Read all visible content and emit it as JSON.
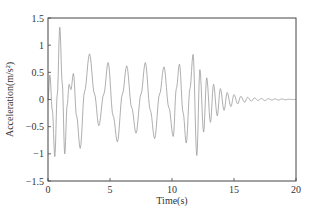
{
  "chart_data": {
    "type": "line",
    "title": "",
    "xlabel": "Time(s)",
    "ylabel": "Acceleration(m/s²)",
    "xlim": [
      0,
      20
    ],
    "ylim": [
      -1.5,
      1.5
    ],
    "xticks": [
      0,
      5,
      10,
      15,
      20
    ],
    "xtick_labels": [
      "0",
      "5",
      "10",
      "15",
      "20"
    ],
    "yticks": [
      1.5,
      1,
      0.5,
      0,
      -0.5,
      -1,
      -1.5
    ],
    "ytick_labels": [
      "1.5",
      "1",
      "0.5",
      "0",
      "-0.5",
      "-1",
      "-1.5"
    ],
    "grid": false,
    "legend": null,
    "line_color": "#9a9a9a",
    "series": [
      {
        "name": "acceleration",
        "x": [
          0,
          0.15,
          0.35,
          0.55,
          0.75,
          0.95,
          1.15,
          1.35,
          1.55,
          1.7,
          1.85,
          2.05,
          2.3,
          2.6,
          2.95,
          3.35,
          3.75,
          4.1,
          4.5,
          4.85,
          5.25,
          5.6,
          6.0,
          6.35,
          6.75,
          7.1,
          7.5,
          7.85,
          8.25,
          8.6,
          9.0,
          9.35,
          9.75,
          10.1,
          10.35,
          10.6,
          10.9,
          11.15,
          11.45,
          11.7,
          12.0,
          12.25,
          12.55,
          12.8,
          13.1,
          13.35,
          13.65,
          13.9,
          14.2,
          14.45,
          14.75,
          15.0,
          15.3,
          15.55,
          15.85,
          16.1,
          16.4,
          16.65,
          16.95,
          17.2,
          17.5,
          17.75,
          18.05,
          18.3,
          18.6,
          18.85,
          19.15,
          19.4,
          19.7,
          20.0
        ],
        "y": [
          0.0,
          0.45,
          -0.2,
          -1.05,
          0.1,
          1.33,
          0.3,
          -1.0,
          -0.1,
          0.28,
          0.18,
          0.48,
          -0.3,
          -0.9,
          0.15,
          0.84,
          0.1,
          -0.48,
          0.1,
          0.68,
          -0.3,
          -0.78,
          0.1,
          0.62,
          -0.15,
          -0.62,
          0.1,
          0.68,
          -0.2,
          -0.72,
          0.1,
          0.6,
          -0.15,
          -0.68,
          0.2,
          0.65,
          -0.25,
          -0.8,
          0.2,
          0.83,
          -1.03,
          0.55,
          -0.6,
          0.4,
          -0.42,
          0.28,
          -0.3,
          0.2,
          -0.2,
          0.13,
          -0.13,
          0.09,
          -0.08,
          0.06,
          -0.05,
          0.04,
          -0.03,
          0.03,
          -0.02,
          0.02,
          -0.02,
          0.015,
          -0.01,
          0.01,
          -0.01,
          0.01,
          -0.005,
          0.005,
          0.0,
          0.0
        ]
      }
    ]
  }
}
